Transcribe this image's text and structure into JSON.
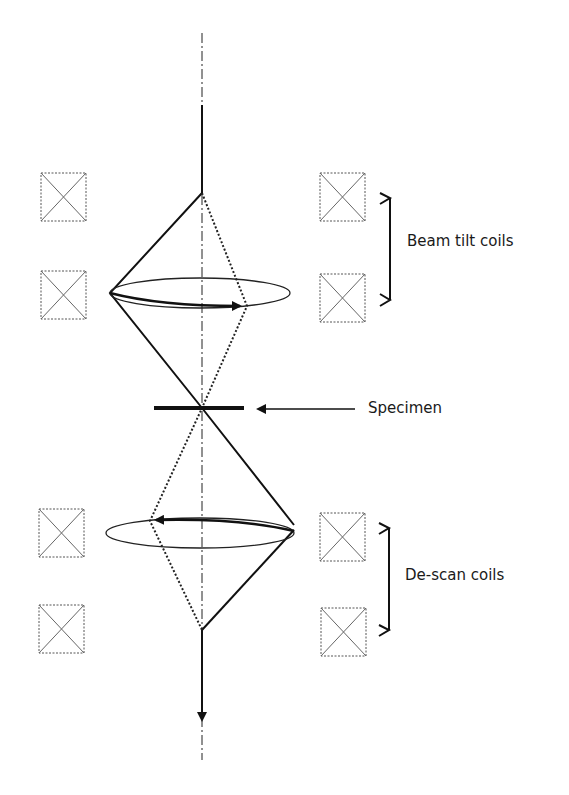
{
  "diagram": {
    "type": "beam-tilt / de-scan schematic",
    "labels": {
      "beam_tilt": "Beam tilt coils",
      "specimen": "Specimen",
      "descan": "De-scan coils"
    },
    "colors": {
      "line": "#111111",
      "coil_border": "#555555",
      "background": "#ffffff"
    },
    "coils": {
      "left": [
        "coil-1",
        "coil-2",
        "coil-3",
        "coil-4"
      ],
      "right": [
        "coil-1",
        "coil-2",
        "coil-3",
        "coil-4"
      ]
    }
  }
}
